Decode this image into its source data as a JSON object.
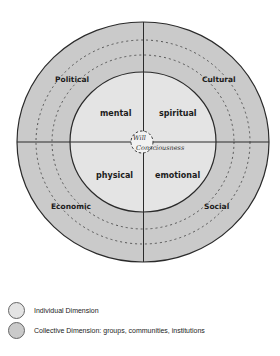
{
  "diagram": {
    "core": {
      "top_label": "Will",
      "bottom_label": "Consciousness"
    },
    "individual_quadrants": {
      "top_left": "mental",
      "top_right": "spiritual",
      "bottom_left": "physical",
      "bottom_right": "emotional"
    },
    "collective_quadrants": {
      "top_left": "Political",
      "top_right": "Cultural",
      "bottom_left": "Economic",
      "bottom_right": "Social"
    },
    "colors": {
      "individual_fill": "#e4e4e4",
      "collective_fill": "#cacaca",
      "line": "#2a2a2a"
    }
  },
  "legend": {
    "items": [
      {
        "label": "Individual Dimension",
        "color": "#e4e4e4"
      },
      {
        "label": "Collective Dimension: groups, communities, institutions",
        "color": "#cacaca"
      }
    ]
  }
}
